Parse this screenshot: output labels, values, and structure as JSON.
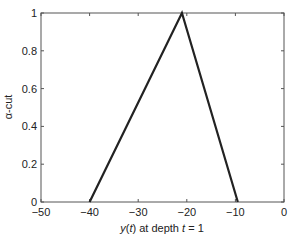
{
  "chart_data": {
    "type": "line",
    "title": "",
    "xlabel": "y(t) at depth t = 1",
    "xlabel_parts": {
      "var": "y",
      "open": "(",
      "arg": "t",
      "close": ") at depth ",
      "var2": "t",
      "rest": " = 1"
    },
    "ylabel": "α-cut",
    "xlim": [
      -50,
      0
    ],
    "ylim": [
      0,
      1
    ],
    "xticks": [
      -50,
      -40,
      -30,
      -20,
      -10,
      0
    ],
    "xtick_labels": [
      "−50",
      "−40",
      "−30",
      "−20",
      "−10",
      "0"
    ],
    "yticks": [
      0,
      0.2,
      0.4,
      0.6,
      0.8,
      1
    ],
    "ytick_labels": [
      "0",
      "0.2",
      "0.4",
      "0.6",
      "0.8",
      "1"
    ],
    "grid": false,
    "legend": null,
    "series": [
      {
        "name": "triangular membership",
        "x": [
          -40,
          -21,
          -9.5
        ],
        "y": [
          0,
          1,
          0
        ],
        "color": "#222222"
      }
    ]
  }
}
